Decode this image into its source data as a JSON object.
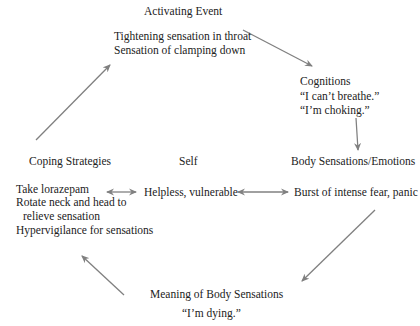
{
  "activating_event": {
    "heading": "Activating Event",
    "lines": [
      "Tightening sensation in throat",
      "Sensation of clamping down"
    ]
  },
  "cognitions": {
    "heading": "Cognitions",
    "lines": [
      "“I can’t breathe.”",
      "“I’m choking.”"
    ]
  },
  "body_sensations": {
    "heading": "Body Sensations/Emotions",
    "lines": [
      "Burst of intense fear, panic"
    ]
  },
  "self": {
    "heading": "Self",
    "lines": [
      "Helpless, vulnerable"
    ]
  },
  "coping": {
    "heading": "Coping Strategies",
    "lines": [
      "Take lorazepam",
      "Rotate neck and head to",
      "relieve sensation",
      "Hypervigilance for sensations"
    ]
  },
  "meaning": {
    "heading": "Meaning of Body Sensations",
    "lines": [
      "“I’m dying.”"
    ]
  },
  "colors": {
    "arrow": "#808080",
    "text": "#222222"
  }
}
